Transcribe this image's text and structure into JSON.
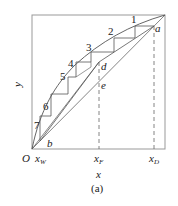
{
  "diagram": {
    "type": "McCabe-Thiele distillation diagram",
    "caption": "(a)",
    "axes": {
      "x_label": "x",
      "y_label": "y",
      "origin_label": "O"
    },
    "x_ticks": [
      {
        "base": "x",
        "sub": "W"
      },
      {
        "base": "x",
        "sub": "F"
      },
      {
        "base": "x",
        "sub": "D"
      }
    ],
    "points": {
      "a": "a",
      "b": "b",
      "d": "d",
      "e": "e"
    },
    "stage_labels": [
      "1",
      "2",
      "3",
      "4",
      "5",
      "6",
      "7"
    ],
    "colors": {
      "line": "#555555",
      "frame": "#888888",
      "text": "#222222"
    }
  }
}
